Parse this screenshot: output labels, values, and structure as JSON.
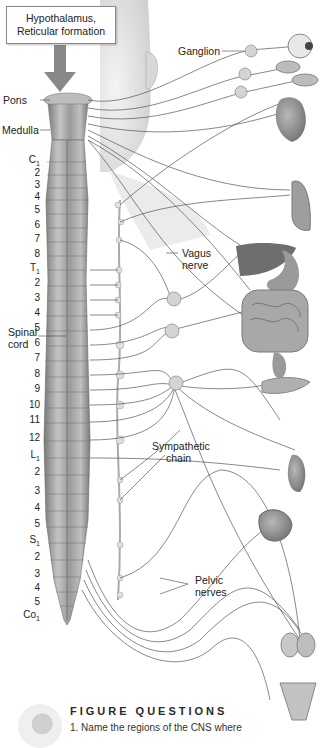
{
  "figure": {
    "callout_box": {
      "line1": "Hypothalamus,",
      "line2": "Reticular formation"
    },
    "labels": {
      "pons": "Pons",
      "medulla": "Medulla",
      "spinal_cord_1": "Spinal",
      "spinal_cord_2": "cord",
      "ganglion": "Ganglion",
      "vagus_1": "Vagus",
      "vagus_2": "nerve",
      "sympathetic_1": "Sympathetic",
      "sympathetic_2": "chain",
      "pelvic_1": "Pelvic",
      "pelvic_2": "nerves"
    },
    "spinal_segments": [
      {
        "label": "C",
        "sub": "1",
        "y": 160
      },
      {
        "label": "2",
        "sub": "",
        "y": 173
      },
      {
        "label": "3",
        "sub": "",
        "y": 185
      },
      {
        "label": "4",
        "sub": "",
        "y": 197
      },
      {
        "label": "5",
        "sub": "",
        "y": 210
      },
      {
        "label": "6",
        "sub": "",
        "y": 225
      },
      {
        "label": "7",
        "sub": "",
        "y": 239
      },
      {
        "label": "8",
        "sub": "",
        "y": 254
      },
      {
        "label": "T",
        "sub": "1",
        "y": 268
      },
      {
        "label": "2",
        "sub": "",
        "y": 283
      },
      {
        "label": "3",
        "sub": "",
        "y": 298
      },
      {
        "label": "4",
        "sub": "",
        "y": 313
      },
      {
        "label": "5",
        "sub": "",
        "y": 328
      },
      {
        "label": "6",
        "sub": "",
        "y": 343
      },
      {
        "label": "7",
        "sub": "",
        "y": 358
      },
      {
        "label": "8",
        "sub": "",
        "y": 374
      },
      {
        "label": "9",
        "sub": "",
        "y": 389
      },
      {
        "label": "10",
        "sub": "",
        "y": 405
      },
      {
        "label": "11",
        "sub": "",
        "y": 420
      },
      {
        "label": "12",
        "sub": "",
        "y": 438
      },
      {
        "label": "L",
        "sub": "1",
        "y": 455
      },
      {
        "label": "2",
        "sub": "",
        "y": 472
      },
      {
        "label": "3",
        "sub": "",
        "y": 491
      },
      {
        "label": "4",
        "sub": "",
        "y": 508
      },
      {
        "label": "5",
        "sub": "",
        "y": 524
      },
      {
        "label": "S",
        "sub": "1",
        "y": 540
      },
      {
        "label": "2",
        "sub": "",
        "y": 557
      },
      {
        "label": "3",
        "sub": "",
        "y": 574
      },
      {
        "label": "4",
        "sub": "",
        "y": 588
      },
      {
        "label": "5",
        "sub": "",
        "y": 602
      },
      {
        "label": "Co",
        "sub": "1",
        "y": 615
      }
    ],
    "organs": [
      "eye",
      "salivary-glands",
      "heart",
      "lung",
      "liver",
      "stomach",
      "intestines",
      "rectum",
      "pancreas",
      "kidney-adrenal",
      "bladder",
      "testes",
      "uterus"
    ]
  },
  "figure_questions": {
    "title": "FIGURE QUESTIONS",
    "item1": "1. Name the regions of the CNS where"
  },
  "colors": {
    "cord": "#9a9a9a",
    "nerve": "#555555",
    "organ": "#8c8c8c",
    "skin": "#e6e6e6"
  }
}
